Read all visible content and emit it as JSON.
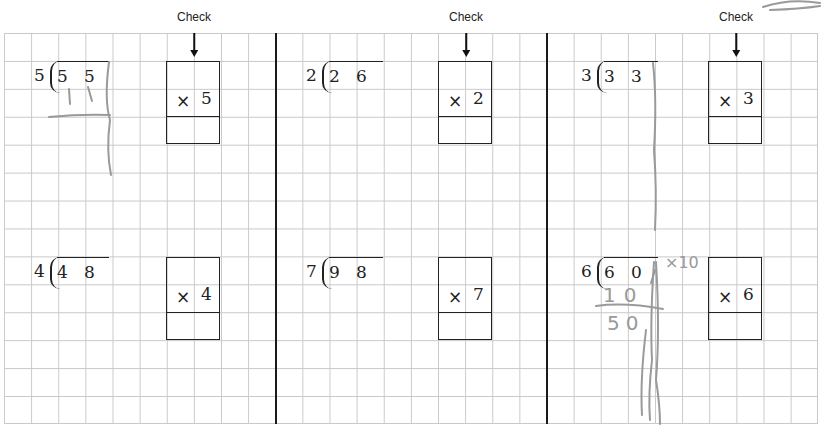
{
  "check_label": "Check",
  "columns": [
    {
      "check_label_x": 203,
      "problems": [
        {
          "divisor": "5",
          "dividend": [
            "5",
            "5"
          ],
          "multiplier": "5",
          "pos": {
            "x": 33,
            "y": 61
          },
          "box": {
            "x": 166,
            "y": 61
          }
        },
        {
          "divisor": "4",
          "dividend": [
            "4",
            "8"
          ],
          "multiplier": "4",
          "pos": {
            "x": 33,
            "y": 257
          },
          "box": {
            "x": 166,
            "y": 257
          }
        }
      ]
    },
    {
      "check_label_x": 466,
      "problems": [
        {
          "divisor": "2",
          "dividend": [
            "2",
            "6"
          ],
          "multiplier": "2",
          "pos": {
            "x": 306,
            "y": 61
          },
          "box": {
            "x": 438,
            "y": 61
          }
        },
        {
          "divisor": "7",
          "dividend": [
            "9",
            "8"
          ],
          "multiplier": "7",
          "pos": {
            "x": 306,
            "y": 257
          },
          "box": {
            "x": 438,
            "y": 257
          }
        }
      ]
    },
    {
      "check_label_x": 736,
      "problems": [
        {
          "divisor": "3",
          "dividend": [
            "3",
            "3"
          ],
          "multiplier": "3",
          "pos": {
            "x": 581,
            "y": 61
          },
          "box": {
            "x": 708,
            "y": 61
          }
        },
        {
          "divisor": "6",
          "dividend": [
            "6",
            "0"
          ],
          "multiplier": "6",
          "pos": {
            "x": 581,
            "y": 257
          },
          "box": {
            "x": 708,
            "y": 257
          }
        }
      ]
    }
  ],
  "handwriting": {
    "p1_quotient": "1 1",
    "p6_note": "×10",
    "p6_subtract": "10",
    "p6_remainder": "50"
  },
  "colors": {
    "grid": "#c9c9c9",
    "ink": "#222222",
    "pencil": "#999999"
  }
}
